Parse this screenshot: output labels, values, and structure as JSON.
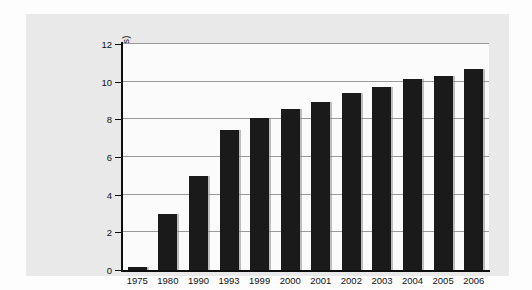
{
  "chart_data": {
    "type": "bar",
    "title": "",
    "xlabel": "",
    "ylabel": "Employees (in millions)",
    "categories": [
      "1975",
      "1980",
      "1990",
      "1993",
      "1999",
      "2000",
      "2001",
      "2002",
      "2003",
      "2004",
      "2005",
      "2006"
    ],
    "values": [
      0.15,
      3.0,
      5.0,
      7.45,
      8.05,
      8.55,
      8.9,
      9.4,
      9.7,
      10.15,
      10.3,
      10.65
    ],
    "ylim": [
      0,
      12
    ],
    "yticks": [
      0,
      2,
      4,
      6,
      8,
      10,
      12
    ],
    "ytick_labels": [
      "0",
      "2",
      "4",
      "6",
      "8",
      "10",
      "12"
    ],
    "grid": true,
    "legend": false,
    "bar_color": "#1a1a1a",
    "gridline_color": "#9a9a9a",
    "axis_color": "#0d0d0d",
    "panel_color": "#e9e9e9",
    "plot_background": "#fbfbfb"
  }
}
